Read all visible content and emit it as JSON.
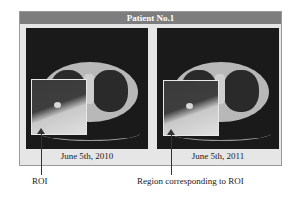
{
  "figure": {
    "title": "Patient No.1",
    "panels": [
      {
        "date": "June 5th, 2010",
        "annotation": "ROI"
      },
      {
        "date": "June 5th, 2011",
        "annotation": "Region corresponding to ROI"
      }
    ]
  }
}
